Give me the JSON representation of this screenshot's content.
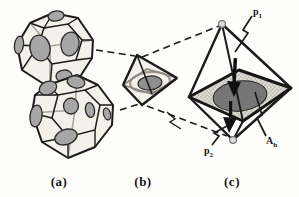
{
  "figure": {
    "captions": {
      "a": "(a)",
      "b": "(b)",
      "c": "(c)"
    },
    "labels": {
      "p1": {
        "base": "p",
        "sub": "1"
      },
      "p2": {
        "base": "p",
        "sub": "2"
      },
      "ah": {
        "base": "A",
        "sub": "h"
      }
    },
    "icons": {
      "zigzag-leader": "lightning-bolt polyline",
      "dashed-connector": "dashed magnification line",
      "vertex-marker": "small open circle",
      "down-arrow": "filled black arrow"
    }
  },
  "colors": {
    "paper": "#fdfdfb",
    "ink": "#1b1b1b",
    "cage_face": "#f4f1eb",
    "window_disk": "#a6a6a6",
    "panel_b_disk": "#8f8f8f",
    "plane_fill": "#dedbd4",
    "plane_dot": "#9b988f",
    "panel_c_disk": "#767676",
    "vertex_marker": "#dcdcdc"
  }
}
